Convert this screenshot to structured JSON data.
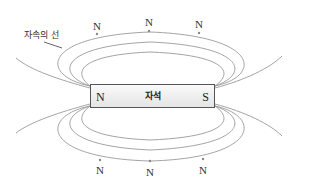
{
  "diagram": {
    "title_label": "자속의 선",
    "magnet": {
      "name": "자석",
      "left_pole": "N",
      "right_pole": "S"
    },
    "top_markers": [
      "N",
      "N",
      "N"
    ],
    "bottom_markers": [
      "N",
      "N",
      "N"
    ],
    "colors": {
      "field_line": "#9a9a9a",
      "magnet_border": "#555555",
      "text": "#333333"
    }
  }
}
